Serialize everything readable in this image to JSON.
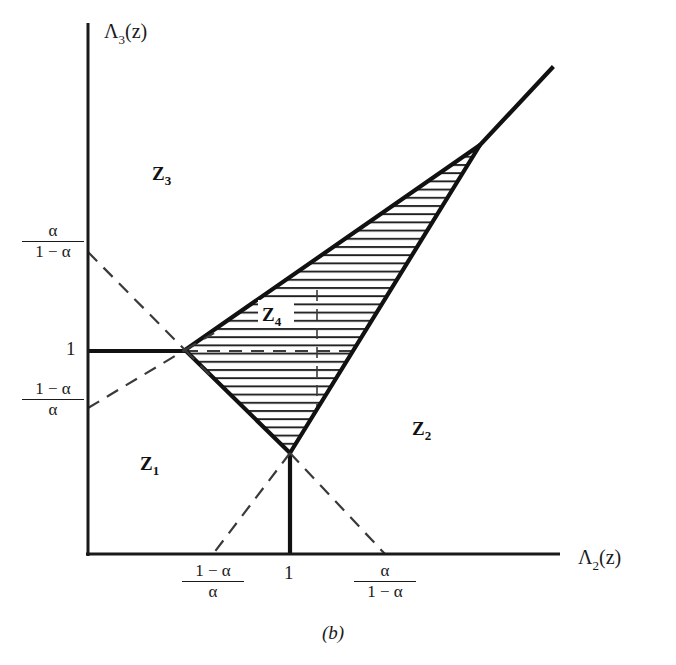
{
  "figure": {
    "caption": "(b)",
    "axes": {
      "x_label_main": "Λ",
      "x_label_sub": "2",
      "x_label_arg": "(z)",
      "y_label_main": "Λ",
      "y_label_sub": "3",
      "y_label_arg": "(z)"
    },
    "x_ticks": [
      {
        "name": "x-tick-one-minus-alpha-over-alpha",
        "numerator": "1 − α",
        "denominator": "α",
        "type": "fraction",
        "value_px": 213
      },
      {
        "name": "x-tick-one",
        "label": "1",
        "type": "plain",
        "value_px": 290
      },
      {
        "name": "x-tick-alpha-over-one-minus-alpha",
        "numerator": "α",
        "denominator": "1 − α",
        "type": "fraction",
        "value_px": 385
      }
    ],
    "y_ticks": [
      {
        "name": "y-tick-alpha-over-one-minus-alpha",
        "numerator": "α",
        "denominator": "1 − α",
        "type": "fraction",
        "value_px": 252
      },
      {
        "name": "y-tick-one",
        "label": "1",
        "type": "plain",
        "value_px": 351
      },
      {
        "name": "y-tick-one-minus-alpha-over-alpha",
        "numerator": "1 − α",
        "denominator": "α",
        "type": "fraction",
        "value_px": 408
      }
    ],
    "zones": [
      {
        "name": "zone-label-z1",
        "main": "Z",
        "sub": "1",
        "x": 140,
        "y": 470
      },
      {
        "name": "zone-label-z2",
        "main": "Z",
        "sub": "2",
        "x": 412,
        "y": 435
      },
      {
        "name": "zone-label-z3",
        "main": "Z",
        "sub": "3",
        "x": 152,
        "y": 180
      },
      {
        "name": "zone-label-z4",
        "main": "Z",
        "sub": "4",
        "x": 267,
        "y": 317
      }
    ],
    "colors": {
      "ink": "#1a1a1a",
      "hatch": "#222222",
      "dash": "#3a3a3a",
      "background": "#ffffff"
    },
    "geometry": {
      "origin": [
        88,
        554
      ],
      "x_axis_end": [
        560,
        554
      ],
      "y_axis_top": [
        88,
        23
      ],
      "vertex_left": [
        185,
        350
      ],
      "vertex_bottom": [
        290,
        453
      ],
      "vertex_apex": [
        480,
        145
      ],
      "ray_end": [
        552,
        68
      ]
    }
  }
}
